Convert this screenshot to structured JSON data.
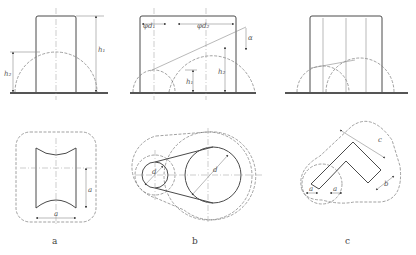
{
  "figure": {
    "panels": [
      {
        "id": "a",
        "caption": "a",
        "elevation_labels": {
          "h1": "h₁",
          "h2": "h₂"
        },
        "plan_labels": {
          "width": "a",
          "height": "a"
        }
      },
      {
        "id": "b",
        "caption": "b",
        "elevation_labels": {
          "d1": "φd₁",
          "d2": "φd₂",
          "alpha": "α",
          "h1": "h₁",
          "h2": "h₂"
        },
        "plan_labels": {
          "small_diameter": "d",
          "large_diameter": "d"
        }
      },
      {
        "id": "c",
        "caption": "c",
        "elevation_labels": {},
        "plan_labels": {
          "arm_length": "c",
          "width_left": "a",
          "width_mid": "a",
          "width_right": "b"
        }
      }
    ],
    "colors": {
      "line": "#4a4a4a",
      "background": "#ffffff"
    }
  }
}
